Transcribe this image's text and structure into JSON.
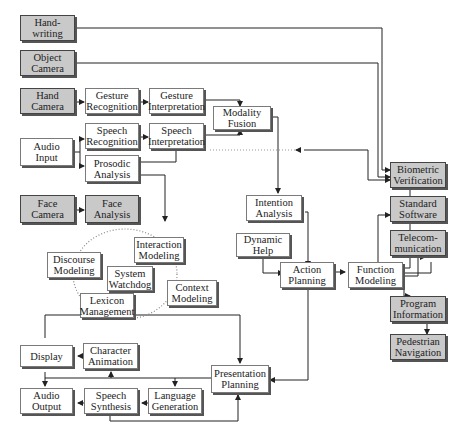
{
  "diagram": {
    "inputs": {
      "handwriting": "Hand-\nwriting",
      "object_camera": "Object\nCamera",
      "hand_camera": "Hand\nCamera",
      "audio_input": "Audio\nInput",
      "face_camera": "Face\nCamera"
    },
    "recognition": {
      "gesture_recognition": "Gesture\nRecognition",
      "gesture_interpretation": "Gesture\nInterpretation",
      "speech_recognition": "Speech\nRecognition",
      "speech_interpretation": "Speech\nInterpretation",
      "prosodic_analysis": "Prosodic\nAnalysis",
      "face_analysis": "Face\nAnalysis",
      "modality_fusion": "Modality\nFusion"
    },
    "knowledge": {
      "discourse_modeling": "Discourse\nModeling",
      "interaction_modeling": "Interaction\nModeling",
      "system_watchdog": "System\nWatchdog",
      "context_modeling": "Context\nModeling",
      "lexicon_management": "Lexicon\nManagement"
    },
    "planning": {
      "intention_analysis": "Intention\nAnalysis",
      "dynamic_help": "Dynamic\nHelp",
      "action_planning": "Action\nPlanning",
      "function_modeling": "Function\nModeling"
    },
    "applications": {
      "biometric_verification": "Biometric\nVerification",
      "standard_software": "Standard\nSoftware",
      "telecommunication": "Telecom-\nmunication",
      "program_information": "Program\nInformation",
      "pedestrian_navigation": "Pedestrian\nNavigation"
    },
    "output": {
      "display": "Display",
      "character_animation": "Character\nAnimation",
      "presentation_planning": "Presentation\nPlanning",
      "audio_output": "Audio\nOutput",
      "speech_synthesis": "Speech\nSynthesis",
      "language_generation": "Language\nGeneration"
    },
    "colors": {
      "input_box_fill": "#c9c9c9",
      "process_box_fill": "#ffffff",
      "line": "#222222"
    }
  }
}
